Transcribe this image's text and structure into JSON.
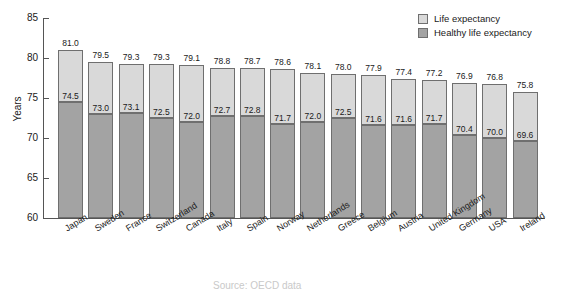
{
  "chart_data": {
    "type": "bar",
    "subtype": "overlaid-stacked",
    "title": "",
    "xlabel": "",
    "ylabel": "Years",
    "ylim": [
      60,
      85
    ],
    "yticks": [
      60,
      65,
      70,
      75,
      80,
      85
    ],
    "grid": false,
    "legend_position": "top-right",
    "categories": [
      "Japan",
      "Sweden",
      "France",
      "Switzerland",
      "Canada",
      "Italy",
      "Spain",
      "Norway",
      "Netherlands",
      "Greece",
      "Belgium",
      "Austria",
      "United Kingdom",
      "Germany",
      "USA",
      "Ireland"
    ],
    "series": [
      {
        "name": "Life expectancy",
        "color": "#d9d9d9",
        "values": [
          81.0,
          79.5,
          79.3,
          79.3,
          79.1,
          78.8,
          78.7,
          78.6,
          78.1,
          78.0,
          77.9,
          77.4,
          77.2,
          76.9,
          76.8,
          75.8
        ]
      },
      {
        "name": "Healthy life expectancy",
        "color": "#a3a3a3",
        "values": [
          74.5,
          73.0,
          73.1,
          72.5,
          72.0,
          72.7,
          72.8,
          71.7,
          72.0,
          72.5,
          71.6,
          71.6,
          71.7,
          70.4,
          70.0,
          69.6
        ]
      }
    ]
  },
  "legend": {
    "items": [
      {
        "label": "Life expectancy",
        "color": "#d9d9d9"
      },
      {
        "label": "Healthy life expectancy",
        "color": "#a3a3a3"
      }
    ]
  },
  "caption": {
    "text": "Source: OECD data"
  }
}
